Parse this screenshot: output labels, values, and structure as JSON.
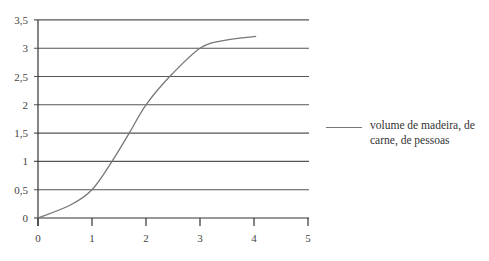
{
  "chart_data": {
    "type": "line",
    "title": "",
    "xlabel": "",
    "ylabel": "",
    "xlim": [
      0,
      5
    ],
    "ylim": [
      0,
      3.5
    ],
    "x_ticks": [
      "0",
      "1",
      "2",
      "3",
      "4",
      "5"
    ],
    "y_ticks": [
      "0",
      "0,5",
      "1",
      "1,5",
      "2",
      "2,5",
      "3",
      "3,5"
    ],
    "grid": {
      "horizontal": true,
      "vertical": false
    },
    "legend_position": "right",
    "series": [
      {
        "name": "volume de madeira, de carne, de pessoas",
        "color": "#777777",
        "smooth": true,
        "x": [
          0,
          0.6,
          1.0,
          1.37,
          1.69,
          2.0,
          2.44,
          3.0,
          3.4,
          4.04
        ],
        "y": [
          0,
          0.23,
          0.5,
          1.0,
          1.5,
          2.0,
          2.5,
          3.0,
          3.13,
          3.21
        ]
      }
    ]
  },
  "legend": {
    "label": "volume de madeira, de carne, de pessoas"
  },
  "style": {
    "grid_color": "#555555",
    "axis_color": "#333333",
    "line_color": "#777777"
  },
  "layout": {
    "plot_left": 38,
    "plot_right": 309,
    "plot_top": 20,
    "plot_bottom": 218,
    "x_px_per_unit": 54,
    "y_px_per_unit": 56.6
  }
}
